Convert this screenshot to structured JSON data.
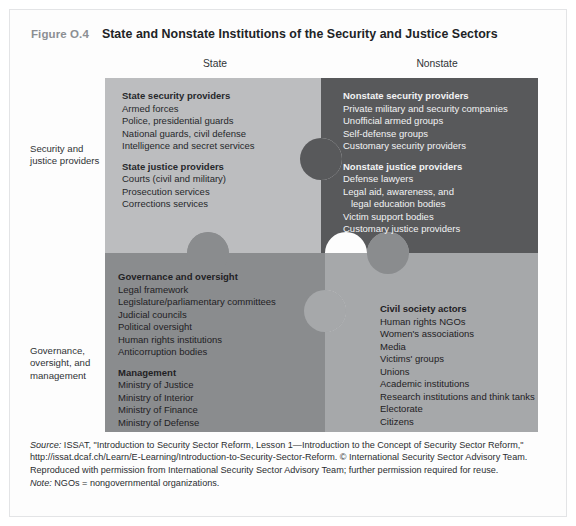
{
  "figure": {
    "number": "Figure O.4",
    "title": "State and Nonstate Institutions of the Security and Justice Sectors"
  },
  "columns": {
    "state": "State",
    "nonstate": "Nonstate"
  },
  "rows": {
    "providers": "Security and justice providers",
    "governance": "Governance, oversight, and management"
  },
  "colors": {
    "quadrant_top_left": "#bcbdbf",
    "quadrant_top_right": "#58595b",
    "quadrant_bottom_left": "#8a8c8e",
    "quadrant_bottom_right": "#a6a8aa",
    "knob_dark": "#58595b",
    "knob_mid": "#8a8c8e",
    "knob_light": "#a6a8aa",
    "title_number": "#8c8f93",
    "title_text": "#212326"
  },
  "quadrants": {
    "state_providers": {
      "groups": [
        {
          "heading": "State security providers",
          "items": [
            "Armed forces",
            "Police, presidential guards",
            "National guards, civil defense",
            "Intelligence and secret services"
          ]
        },
        {
          "heading": "State justice providers",
          "items": [
            "Courts (civil and military)",
            "Prosecution services",
            "Corrections services"
          ]
        }
      ]
    },
    "nonstate_providers": {
      "groups": [
        {
          "heading": "Nonstate security providers",
          "items": [
            "Private military and security companies",
            "Unofficial armed groups",
            "Self-defense groups",
            "Customary security providers"
          ]
        },
        {
          "heading": "Nonstate justice providers",
          "items": [
            "Defense lawyers",
            "Legal aid, awareness, and",
            "   legal education bodies",
            "Victim support bodies",
            "Customary justice providers"
          ]
        }
      ]
    },
    "state_governance": {
      "groups": [
        {
          "heading": "Governance and oversight",
          "items": [
            "Legal framework",
            "Legislature/parliamentary committees",
            "Judicial councils",
            "Political oversight",
            "Human rights institutions",
            "Anticorruption bodies"
          ]
        },
        {
          "heading": "Management",
          "items": [
            "Ministry of Justice",
            "Ministry of Interior",
            "Ministry of Finance",
            "Ministry of Defense"
          ]
        }
      ]
    },
    "nonstate_governance": {
      "groups": [
        {
          "heading": "Civil society actors",
          "items": [
            "Human rights NGOs",
            "Women's associations",
            "Media",
            "Victims' groups",
            "Unions",
            "Academic institutions",
            "Research institutions and think tanks",
            "Electorate",
            "Citizens"
          ]
        }
      ]
    }
  },
  "footnotes": {
    "source_label": "Source:",
    "source_text": " ISSAT, \"Introduction to Security Sector Reform, Lesson 1—Introduction to the Concept of Security Sector Reform,\" http://issat.dcaf.ch/Learn/E-Learning/Introduction-to-Security-Sector-Reform. © International Security Sector Advisory Team. Reproduced with permission from International Security Sector Advisory Team; further permission required for reuse.",
    "note_label": "Note:",
    "note_text": " NGOs = nongovernmental organizations."
  }
}
